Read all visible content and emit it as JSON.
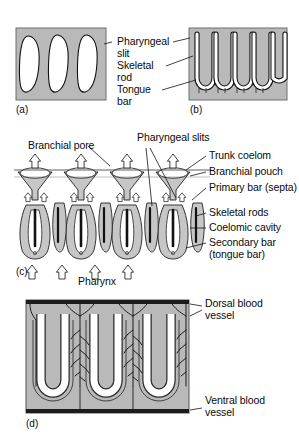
{
  "figure": {
    "colors": {
      "tissue_gray": "#b9b9b9",
      "tissue_gray_light": "#c6c6c6",
      "lumen_white": "#ffffff",
      "outline_black": "#111111",
      "text_black": "#0a0a0a",
      "page_white": "#ffffff"
    }
  },
  "panels": {
    "a": {
      "tag": "(a)",
      "caption": "Simple oval pharyngeal slits",
      "slit_count": 3
    },
    "b": {
      "tag": "(b)",
      "caption": "U-shaped slits with tongue bars",
      "slit_count": 5
    },
    "c": {
      "tag": "(c)",
      "caption": "Cross section through pharynx and branchial pouches",
      "unit_count": 4
    },
    "d": {
      "tag": "(d)",
      "caption": "Vascularized U-shaped slits between dorsal and ventral vessels",
      "slit_count": 3
    }
  },
  "labels": {
    "ab": {
      "pharyngeal_slit": "Pharyngeal\nslit",
      "skeletal_rod": "Skeletal\nrod",
      "tongue_bar": "Tongue\nbar"
    },
    "c": {
      "branchial_pore": "Branchial pore",
      "pharyngeal_slits": "Pharyngeal slits",
      "trunk_coelom": "Trunk coelom",
      "branchial_pouch": "Branchial pouch",
      "primary_bar": "Primary bar (septa)",
      "skeletal_rods": "Skeletal rods",
      "coelomic_cavity": "Coelomic cavity",
      "secondary_bar": "Secondary bar\n(tongue bar)",
      "pharynx": "Pharynx"
    },
    "d": {
      "dorsal_blood_vessel": "Dorsal blood\nvessel",
      "ventral_blood_vessel": "Ventral blood\nvessel"
    }
  }
}
